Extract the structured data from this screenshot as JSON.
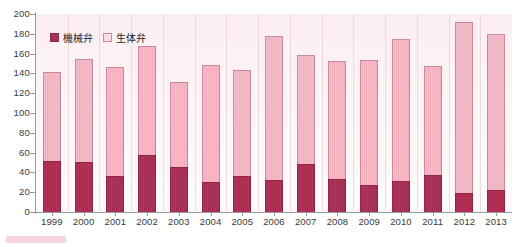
{
  "chart_data": {
    "type": "bar",
    "title": "",
    "subtitle": "",
    "xlabel": "",
    "ylabel": "",
    "ylim": [
      0,
      200
    ],
    "ytick_step": 20,
    "yticks": [
      0,
      20,
      40,
      60,
      80,
      100,
      120,
      140,
      160,
      180,
      200
    ],
    "grid": false,
    "stacked": true,
    "legend_position": "top-left",
    "categories": [
      "1999",
      "2000",
      "2001",
      "2002",
      "2003",
      "2004",
      "2005",
      "2006",
      "2007",
      "2008",
      "2009",
      "2010",
      "2011",
      "2012",
      "2013"
    ],
    "series": [
      {
        "name": "機械弁",
        "color": "#b33359",
        "values": [
          52,
          51,
          36,
          58,
          45,
          30,
          36,
          32,
          48,
          33,
          27,
          31,
          37,
          19,
          22
        ]
      },
      {
        "name": "生体弁",
        "color": "#f6bcc9",
        "values": [
          89,
          104,
          110,
          110,
          86,
          118,
          107,
          146,
          111,
          120,
          127,
          144,
          110,
          173,
          158
        ]
      }
    ],
    "totals": [
      141,
      155,
      146,
      168,
      131,
      148,
      143,
      178,
      159,
      153,
      154,
      175,
      147,
      192,
      180
    ]
  },
  "legend": {
    "items": [
      {
        "label": "機械弁",
        "swatch": "mech-swatch"
      },
      {
        "label": "生体弁",
        "swatch": "bio-swatch"
      }
    ]
  },
  "axes": {
    "y_tick_labels": [
      "200",
      "180",
      "160",
      "140",
      "120",
      "100",
      "80",
      "60",
      "40",
      "20",
      "0"
    ],
    "x_tick_labels": [
      "1999",
      "2000",
      "2001",
      "2002",
      "2003",
      "2004",
      "2005",
      "2006",
      "2007",
      "2008",
      "2009",
      "2010",
      "2011",
      "2012",
      "2013"
    ]
  },
  "colors": {
    "mechanical": "#b33359",
    "bioprosthetic": "#f6bcc9",
    "plot_background": "#fbeef2",
    "axis": "#9a9a9a",
    "text": "#3a3a3a"
  }
}
